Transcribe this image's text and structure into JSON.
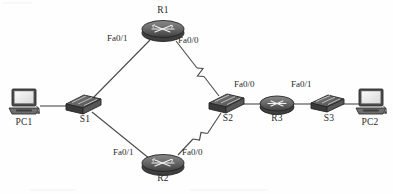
{
  "diagram": {
    "type": "network-topology",
    "width": 393,
    "height": 194,
    "background_color": "#fefefe",
    "line_color": "#4a4a4a",
    "device_fill": "#6b6b6b",
    "device_stroke": "#2e2e2e",
    "text_color": "#2a2a2a"
  },
  "nodes": [
    {
      "id": "PC1",
      "label": "PC1",
      "icon": "pc-icon",
      "type": "pc",
      "x": 24,
      "y": 103,
      "label_x": 24,
      "label_y": 124
    },
    {
      "id": "S1",
      "label": "S1",
      "icon": "switch-icon",
      "type": "switch",
      "x": 83,
      "y": 104,
      "label_x": 85,
      "label_y": 121
    },
    {
      "id": "R1",
      "label": "R1",
      "icon": "router-icon",
      "type": "router",
      "x": 163,
      "y": 30,
      "label_x": 163,
      "label_y": 12
    },
    {
      "id": "R2",
      "label": "R2",
      "icon": "router-icon",
      "type": "router",
      "x": 163,
      "y": 163,
      "label_x": 163,
      "label_y": 178
    },
    {
      "id": "S2",
      "label": "S2",
      "icon": "switch-icon",
      "type": "switch",
      "x": 226,
      "y": 103,
      "label_x": 228,
      "label_y": 120
    },
    {
      "id": "R3",
      "label": "R3",
      "icon": "router-icon",
      "type": "router",
      "x": 277,
      "y": 103,
      "label_x": 277,
      "label_y": 120
    },
    {
      "id": "S3",
      "label": "S3",
      "icon": "switch-icon",
      "type": "switch",
      "x": 327,
      "y": 103,
      "label_x": 329,
      "label_y": 120
    },
    {
      "id": "PC2",
      "label": "PC2",
      "icon": "pc-icon",
      "type": "pc",
      "x": 370,
      "y": 103,
      "label_x": 370,
      "label_y": 124
    }
  ],
  "links": [
    {
      "id": "pc1-s1",
      "from": "PC1",
      "to": "S1",
      "style": "straight",
      "x1": 40,
      "y1": 106,
      "x2": 69,
      "y2": 106
    },
    {
      "id": "s1-r1",
      "from": "S1",
      "to": "R1",
      "style": "straight",
      "x1": 92,
      "y1": 98,
      "x2": 150,
      "y2": 39
    },
    {
      "id": "s1-r2",
      "from": "S1",
      "to": "R2",
      "style": "straight",
      "x1": 92,
      "y1": 113,
      "x2": 150,
      "y2": 160
    },
    {
      "id": "r1-s2",
      "from": "R1",
      "to": "S2",
      "style": "serial-zigzag",
      "x1": 176,
      "y1": 40,
      "x2": 218,
      "y2": 96
    },
    {
      "id": "r2-s2",
      "from": "R2",
      "to": "S2",
      "style": "serial-zigzag",
      "x1": 178,
      "y1": 155,
      "x2": 220,
      "y2": 112
    },
    {
      "id": "s2-r3",
      "from": "S2",
      "to": "R3",
      "style": "straight",
      "x1": 240,
      "y1": 104,
      "x2": 262,
      "y2": 104
    },
    {
      "id": "r3-s3",
      "from": "R3",
      "to": "S3",
      "style": "straight",
      "x1": 292,
      "y1": 104,
      "x2": 313,
      "y2": 104
    },
    {
      "id": "s3-pc2",
      "from": "S3",
      "to": "PC2",
      "style": "straight",
      "x1": 341,
      "y1": 104,
      "x2": 360,
      "y2": 104
    }
  ],
  "interface_labels": [
    {
      "id": "r1-fa01",
      "text": "Fa0/1",
      "node": "R1",
      "link": "s1-r1",
      "x": 111,
      "y": 39
    },
    {
      "id": "r1-fa00",
      "text": "Fa0/0",
      "node": "R1",
      "link": "r1-s2",
      "x": 178,
      "y": 40
    },
    {
      "id": "r2-fa01",
      "text": "Fa0/1",
      "node": "R2",
      "link": "s1-r2",
      "x": 117,
      "y": 152
    },
    {
      "id": "r2-fa00",
      "text": "Fa0/0",
      "node": "R2",
      "link": "r2-s2",
      "x": 184,
      "y": 152
    },
    {
      "id": "r3-fa00",
      "text": "Fa0/0",
      "node": "R3",
      "link": "s2-r3",
      "x": 236,
      "y": 85
    },
    {
      "id": "r3-fa01",
      "text": "Fa0/1",
      "node": "R3",
      "link": "r3-s3",
      "x": 293,
      "y": 85
    }
  ]
}
